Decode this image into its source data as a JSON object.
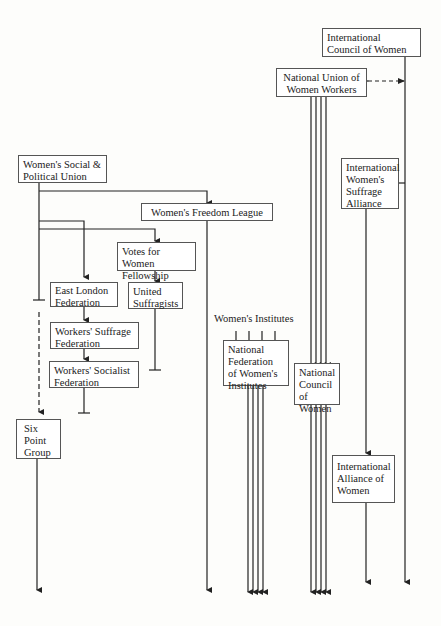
{
  "diagram": {
    "type": "organisational lineage diagram",
    "nodes": {
      "icw": {
        "label": "International Council of Women"
      },
      "nuww": {
        "label": "National Union of Women Workers"
      },
      "wspu": {
        "label": "Women's Social & Political Union"
      },
      "wfl": {
        "label": "Women's Freedom League"
      },
      "iwsa": {
        "label": "International Women's Suffrage Alliance"
      },
      "vfwf": {
        "label": "Votes for Women Fellowship"
      },
      "elf": {
        "label": "East London Federation"
      },
      "us": {
        "label": "United Suffragists"
      },
      "wsf": {
        "label": "Workers' Suffrage Federation"
      },
      "wsocf": {
        "label": "Workers' Socialist Federation"
      },
      "wi": {
        "label": "Women's Institutes"
      },
      "nfwi": {
        "label": "National Federation of Women's Institutes"
      },
      "ncw": {
        "label": "National Council of Women"
      },
      "spg": {
        "label": "Six Point Group"
      },
      "iaw": {
        "label": "International Alliance of Women"
      }
    },
    "edges": [
      {
        "from": "wspu",
        "to": "wfl",
        "style": "solid"
      },
      {
        "from": "wspu",
        "to": "vfwf",
        "style": "solid"
      },
      {
        "from": "wspu",
        "to": "elf",
        "style": "solid"
      },
      {
        "from": "wspu",
        "to": "spg",
        "style": "dashed"
      },
      {
        "from": "vfwf",
        "to": "us",
        "style": "solid"
      },
      {
        "from": "elf",
        "to": "wsf",
        "style": "solid"
      },
      {
        "from": "wsf",
        "to": "wsocf",
        "style": "solid"
      },
      {
        "from": "wi",
        "to": "nfwi",
        "style": "solid",
        "multiplicity": 4
      },
      {
        "from": "nuww",
        "to": "ncw",
        "style": "solid",
        "multiplicity": 4
      },
      {
        "from": "nuww",
        "to": "icw",
        "style": "dashed",
        "bidirectional": true
      },
      {
        "from": "icw",
        "to": "iwsa",
        "style": "solid"
      },
      {
        "from": "iwsa",
        "to": "iaw",
        "style": "solid"
      }
    ],
    "terminated": [
      "wspu",
      "vfwf",
      "us",
      "wsocf"
    ]
  }
}
